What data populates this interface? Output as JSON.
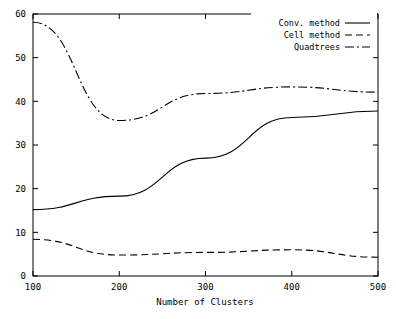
{
  "chart_data": {
    "type": "line",
    "title": "",
    "xlabel": "Number of Clusters",
    "ylabel": "",
    "x": [
      100,
      200,
      300,
      400,
      500
    ],
    "xlim": [
      100,
      500
    ],
    "ylim": [
      0,
      60
    ],
    "xticks": [
      "100",
      "200",
      "300",
      "400",
      "500"
    ],
    "yticks": [
      "0",
      "10",
      "20",
      "30",
      "40",
      "50",
      "60"
    ],
    "grid": false,
    "legend_position": "top-right",
    "series": [
      {
        "name": "Conv. method",
        "style": "solid",
        "values": [
          15.2,
          18.3,
          27.0,
          36.3,
          37.8
        ]
      },
      {
        "name": "Cell method",
        "style": "dashed",
        "values": [
          8.4,
          4.8,
          5.4,
          6.0,
          4.3
        ]
      },
      {
        "name": "Quadtrees",
        "style": "dash-dot",
        "values": [
          58.1,
          35.6,
          41.8,
          43.3,
          42.1
        ]
      }
    ]
  },
  "axes": {
    "x_axis_title": "Number of Clusters"
  },
  "legend": {
    "entries": [
      {
        "label": "Conv. method",
        "style": "solid"
      },
      {
        "label": "Cell method",
        "style": "dashed"
      },
      {
        "label": "Quadtrees",
        "style": "dash-dot"
      }
    ]
  },
  "colors": {
    "line": "#000000",
    "axis": "#000000",
    "background": "#ffffff"
  }
}
